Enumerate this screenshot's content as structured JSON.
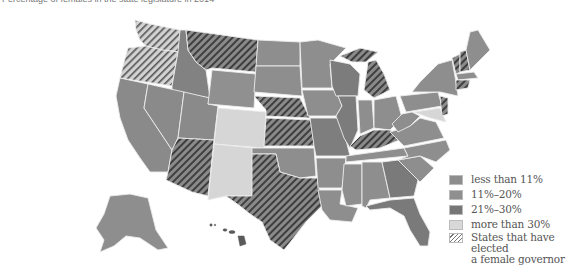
{
  "title": "Percentage of females in the state legislature in 2014",
  "colors": {
    "less_than_11": "#8e8e8e",
    "11_to_20": "#909090",
    "21_to_30": "#7a7a7a",
    "more_than_30": "#d6d6d6",
    "border": "#e8e8e8",
    "hatch": "#404040"
  },
  "legend": [
    {
      "key": "less_than_11",
      "label": "less than 11%",
      "color": "#8d8d8d"
    },
    {
      "key": "11_to_20",
      "label": "11%–20%",
      "color": "#8f8f8f"
    },
    {
      "key": "21_to_30",
      "label": "21%–30%",
      "color": "#767676"
    },
    {
      "key": "more_than_30",
      "label": "more than 30%",
      "color": "#d8d8d8"
    },
    {
      "key": "female_governor",
      "label": "States that have elected a female governor",
      "line1": "States that have elected",
      "line2": "a female governor",
      "pattern": "hatched"
    }
  ],
  "map_data": {
    "more_than_30": [
      "Colorado",
      "New Mexico",
      "Washington? (hatched)",
      "Maryland"
    ],
    "hatched_states": [
      "Washington",
      "Oregon",
      "Montana",
      "Wyoming",
      "Nebraska",
      "Kansas",
      "Arizona",
      "Texas",
      "Michigan",
      "Kentucky",
      "Vermont",
      "New Hampshire",
      "Connecticut",
      "New Jersey",
      "Delaware"
    ],
    "insets": [
      "Alaska",
      "Hawaii"
    ]
  }
}
